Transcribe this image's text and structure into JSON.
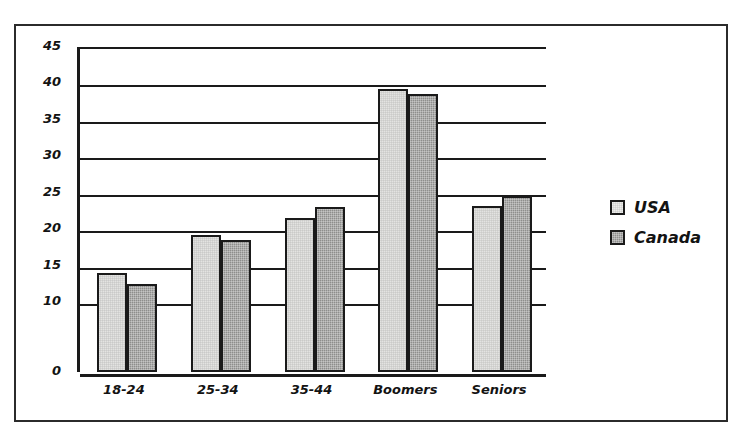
{
  "chart_data": {
    "type": "bar",
    "title": "",
    "subtitle": "",
    "xlabel": "",
    "ylabel": "",
    "categories": [
      "18-24",
      "25-34",
      "35-44",
      "Boomers",
      "Seniors"
    ],
    "series": [
      {
        "name": "USA",
        "values": [
          14.0,
          19.2,
          21.5,
          39.2,
          23.2
        ],
        "color": "#e3e3e1"
      },
      {
        "name": "Canada",
        "values": [
          12.5,
          18.5,
          23.0,
          38.5,
          24.5
        ],
        "color": "#8e8e8c"
      }
    ],
    "ytick_labels": [
      "0",
      "10",
      "15",
      "20",
      "25",
      "30",
      "35",
      "40",
      "45"
    ],
    "ytick_values": [
      0,
      10,
      15,
      20,
      25,
      30,
      35,
      40,
      45
    ],
    "ylim": [
      0,
      45
    ],
    "grid": true,
    "grid_axis": "y",
    "legend_position": "right",
    "legend_entries": [
      "USA",
      "Canada"
    ],
    "annotations": []
  },
  "axis": {
    "y_labels": [
      {
        "text": "45",
        "value": 45
      },
      {
        "text": "40",
        "value": 40
      },
      {
        "text": "35",
        "value": 35
      },
      {
        "text": "30",
        "value": 30
      },
      {
        "text": "25",
        "value": 25
      },
      {
        "text": "20",
        "value": 20
      },
      {
        "text": "15",
        "value": 15
      },
      {
        "text": "10",
        "value": 10
      },
      {
        "text": "0",
        "value": 0
      }
    ],
    "x_labels": [
      "18-24",
      "25-34",
      "35-44",
      "Boomers",
      "Seniors"
    ]
  },
  "legend": {
    "items": [
      {
        "label": "USA",
        "swatch": "usa"
      },
      {
        "label": "Canada",
        "swatch": "canada"
      }
    ]
  },
  "colors": {
    "usa_fill": "#e3e3e1",
    "canada_fill": "#8e8e8c",
    "outline": "#1a1a1a",
    "frame": "#2b2b2b",
    "background": "#ffffff",
    "text": "#131313"
  }
}
